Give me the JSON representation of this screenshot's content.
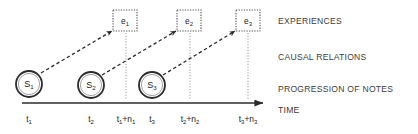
{
  "figure": {
    "background_color": "#ffffff",
    "stroke_color": "#2b2b2b",
    "label_color": "#3d3d3d",
    "guide_color": "#9a9a9a"
  },
  "layer_labels": [
    {
      "id": "experiences",
      "text": "EXPERIENCES",
      "x": 278,
      "y": 17
    },
    {
      "id": "causal-relations",
      "text": "CAUSAL RELATIONS",
      "x": 278,
      "y": 53
    },
    {
      "id": "progression-of-notes",
      "text": "PROGRESSION OF NOTES",
      "x": 278,
      "y": 85
    },
    {
      "id": "time",
      "text": "TIME",
      "x": 278,
      "y": 106
    }
  ],
  "state_nodes": [
    {
      "id": "s1",
      "label": "S",
      "sub": "1",
      "cx": 29,
      "cy": 84,
      "r": 13
    },
    {
      "id": "s2",
      "label": "S",
      "sub": "2",
      "cx": 91,
      "cy": 85,
      "r": 13
    },
    {
      "id": "s3",
      "label": "S",
      "sub": "3",
      "cx": 152,
      "cy": 85,
      "r": 13
    }
  ],
  "event_boxes": [
    {
      "id": "e1",
      "label": "e",
      "sub": "1",
      "x": 113,
      "y": 10,
      "w": 24,
      "h": 21
    },
    {
      "id": "e2",
      "label": "e",
      "sub": "2",
      "x": 177,
      "y": 10,
      "w": 24,
      "h": 21
    },
    {
      "id": "e3",
      "label": "e",
      "sub": "3",
      "x": 236,
      "y": 10,
      "w": 24,
      "h": 21
    }
  ],
  "causal_arrows": [
    {
      "id": "s1-to-e1",
      "x1": 41,
      "y1": 73,
      "x2": 112,
      "y2": 31
    },
    {
      "id": "s2-to-e2",
      "x1": 102,
      "y1": 75,
      "x2": 176,
      "y2": 31
    },
    {
      "id": "s3-to-e3",
      "x1": 163,
      "y1": 75,
      "x2": 235,
      "y2": 31
    }
  ],
  "guide_lines": [
    {
      "id": "guide-e1",
      "x": 126,
      "y1": 33,
      "y2": 100
    },
    {
      "id": "guide-e2",
      "x": 190,
      "y1": 33,
      "y2": 100
    },
    {
      "id": "guide-e3",
      "x": 248,
      "y1": 33,
      "y2": 100
    }
  ],
  "time_axis": {
    "x1": 22,
    "x2": 272,
    "y": 103,
    "arrow_head": true
  },
  "tick_labels": [
    {
      "id": "t1",
      "main": "t",
      "sub": "1",
      "plus": "",
      "main2": "",
      "sub2": "",
      "x": 29,
      "y": 115
    },
    {
      "id": "t2",
      "main": "t",
      "sub": "2",
      "plus": "",
      "main2": "",
      "sub2": "",
      "x": 91,
      "y": 115
    },
    {
      "id": "t1n1",
      "main": "t",
      "sub": "1",
      "plus": "+",
      "main2": "n",
      "sub2": "1",
      "x": 126,
      "y": 115
    },
    {
      "id": "t3",
      "main": "t",
      "sub": "3",
      "plus": "",
      "main2": "",
      "sub2": "",
      "x": 152,
      "y": 115
    },
    {
      "id": "t2n2",
      "main": "t",
      "sub": "2",
      "plus": "+",
      "main2": "n",
      "sub2": "2",
      "x": 190,
      "y": 115
    },
    {
      "id": "t3n3",
      "main": "t",
      "sub": "3",
      "plus": "+",
      "main2": "n",
      "sub2": "3",
      "x": 248,
      "y": 115
    }
  ]
}
